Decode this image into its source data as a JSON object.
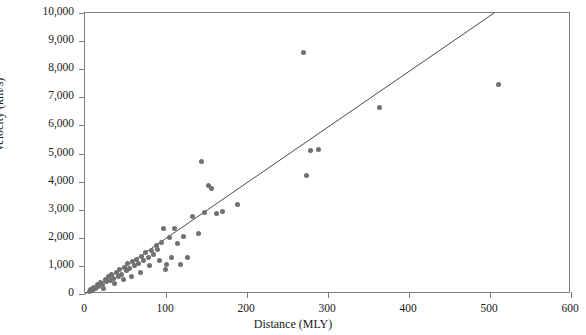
{
  "chart_data": {
    "type": "scatter",
    "title": "",
    "xlabel": "Distance (MLY)",
    "ylabel": "Velocity (km/s)",
    "xlim": [
      0,
      600
    ],
    "ylim": [
      0,
      10000
    ],
    "xticks": [
      0,
      100,
      200,
      300,
      400,
      500,
      600
    ],
    "xtick_labels": [
      "0",
      "100",
      "200",
      "300",
      "400",
      "500",
      "600"
    ],
    "yticks": [
      0,
      1000,
      2000,
      3000,
      4000,
      5000,
      6000,
      7000,
      8000,
      9000,
      10000
    ],
    "ytick_labels": [
      "0",
      "1,000",
      "2,000",
      "3,000",
      "4,000",
      "5,000",
      "6,000",
      "7,000",
      "8,000",
      "9,000",
      "10,000"
    ],
    "grid": false,
    "legend": null,
    "marker_color": "#707070",
    "line_color": "#4a4a4a",
    "axis_color": "#7d7d7d",
    "series": [
      {
        "name": "galaxies",
        "marker": "circle",
        "points": [
          [
            5,
            100
          ],
          [
            7,
            160
          ],
          [
            9,
            120
          ],
          [
            11,
            230
          ],
          [
            13,
            190
          ],
          [
            15,
            330
          ],
          [
            17,
            270
          ],
          [
            19,
            420
          ],
          [
            21,
            330
          ],
          [
            23,
            200
          ],
          [
            25,
            520
          ],
          [
            27,
            430
          ],
          [
            29,
            620
          ],
          [
            31,
            480
          ],
          [
            33,
            700
          ],
          [
            35,
            560
          ],
          [
            37,
            380
          ],
          [
            39,
            760
          ],
          [
            41,
            640
          ],
          [
            43,
            880
          ],
          [
            45,
            700
          ],
          [
            47,
            520
          ],
          [
            49,
            960
          ],
          [
            51,
            820
          ],
          [
            53,
            1070
          ],
          [
            55,
            900
          ],
          [
            57,
            640
          ],
          [
            59,
            1150
          ],
          [
            61,
            1010
          ],
          [
            63,
            1240
          ],
          [
            66,
            1080
          ],
          [
            68,
            760
          ],
          [
            70,
            1330
          ],
          [
            72,
            1180
          ],
          [
            75,
            1470
          ],
          [
            78,
            1290
          ],
          [
            80,
            1000
          ],
          [
            82,
            1560
          ],
          [
            85,
            1420
          ],
          [
            88,
            1720
          ],
          [
            90,
            1600
          ],
          [
            92,
            1180
          ],
          [
            95,
            1850
          ],
          [
            97,
            2340
          ],
          [
            99,
            870
          ],
          [
            101,
            1050
          ],
          [
            104,
            2010
          ],
          [
            107,
            1290
          ],
          [
            110,
            2320
          ],
          [
            114,
            1780
          ],
          [
            118,
            1040
          ],
          [
            122,
            2030
          ],
          [
            126,
            1290
          ],
          [
            133,
            2750
          ],
          [
            140,
            2170
          ],
          [
            144,
            4700
          ],
          [
            148,
            2910
          ],
          [
            152,
            3850
          ],
          [
            156,
            3760
          ],
          [
            162,
            2880
          ],
          [
            170,
            2950
          ],
          [
            188,
            3180
          ],
          [
            270,
            8600
          ],
          [
            274,
            4200
          ],
          [
            278,
            5100
          ],
          [
            288,
            5150
          ],
          [
            363,
            6650
          ],
          [
            510,
            7450
          ]
        ]
      }
    ],
    "fit_line": {
      "x": [
        0,
        505
      ],
      "y": [
        0,
        10000
      ]
    }
  },
  "axes": {
    "x_title": "Distance (MLY)",
    "y_title": "Velocity (km/s)"
  }
}
